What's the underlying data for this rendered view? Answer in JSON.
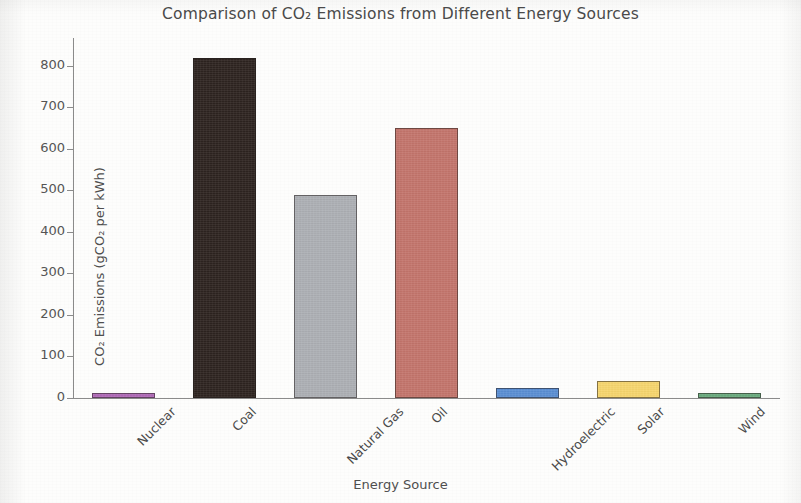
{
  "chart_data": {
    "type": "bar",
    "title": "Comparison of CO₂ Emissions from Different Energy Sources",
    "xlabel": "Energy Source",
    "ylabel": "CO₂ Emissions (gCO₂ per kWh)",
    "categories": [
      "Nuclear",
      "Coal",
      "Natural Gas",
      "Oil",
      "Hydroelectric",
      "Solar",
      "Wind"
    ],
    "values": [
      12,
      820,
      490,
      650,
      24,
      41,
      11
    ],
    "colors": [
      "#b06ab8",
      "#2e2420",
      "#adb0b5",
      "#c4756c",
      "#5b8fd4",
      "#f7d66e",
      "#6aab7e"
    ],
    "ylim": [
      0,
      860
    ],
    "yticks": [
      0,
      100,
      200,
      300,
      400,
      500,
      600,
      700,
      800
    ],
    "ytick_labels": [
      "0",
      "100",
      "200",
      "300",
      "400",
      "500",
      "600",
      "700",
      "800"
    ],
    "grid": false,
    "legend": null,
    "xtick_rotation": -45,
    "background": "#fdfdfc",
    "axis_color": "#8b8b8b",
    "text_color": "#4a4a4a"
  }
}
